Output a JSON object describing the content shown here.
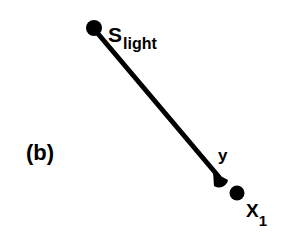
{
  "panel_label": "(b)",
  "nodes": {
    "source": {
      "main": "S",
      "sub": "light"
    },
    "surface_point": {
      "main": "y"
    },
    "observer": {
      "main": "X",
      "sub": "1"
    }
  },
  "colors": {
    "ink": "#000000",
    "background": "#ffffff"
  }
}
